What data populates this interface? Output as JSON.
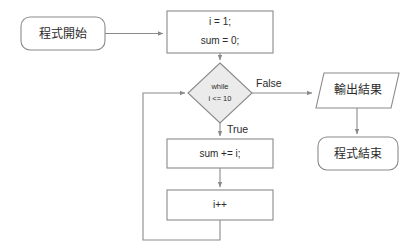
{
  "diagram": {
    "colors": {
      "stroke": "#8a8a8a",
      "text": "#2b2b2b",
      "decision_fill": "#ebebeb",
      "shape_fill": "#ffffff",
      "background": "#ffffff"
    },
    "nodes": {
      "start": {
        "label": "程式開始",
        "shape": "terminator"
      },
      "init": {
        "line1": "i = 1;",
        "line2": "sum = 0;",
        "shape": "process"
      },
      "decision": {
        "line1": "while",
        "line2": "i <= 10",
        "shape": "decision"
      },
      "accumulate": {
        "label": "sum += i;",
        "shape": "process"
      },
      "increment": {
        "label": "i++",
        "shape": "process"
      },
      "output": {
        "label": "輸出結果",
        "shape": "parallelogram"
      },
      "end": {
        "label": "程式結束",
        "shape": "terminator"
      }
    },
    "edge_labels": {
      "false_branch": "False",
      "true_branch": "True"
    }
  }
}
